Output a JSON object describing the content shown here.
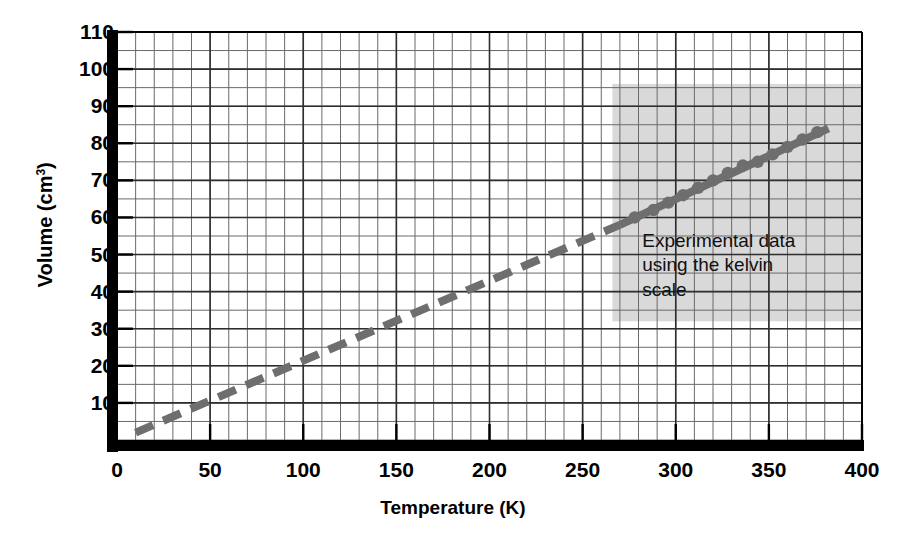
{
  "chart_data": {
    "type": "line",
    "title": "",
    "subtitle": "",
    "xlabel": "Temperature (K)",
    "ylabel": "Volume (cm",
    "ylabel_sup": "3",
    "ylabel_suffix": ")",
    "ylabel_full": "Volume (cm3 )",
    "xlim": [
      0,
      400
    ],
    "ylim": [
      0,
      110
    ],
    "x_ticks": [
      0,
      50,
      100,
      150,
      200,
      250,
      300,
      350,
      400
    ],
    "y_ticks": [
      10,
      20,
      30,
      40,
      50,
      60,
      70,
      80,
      90,
      100,
      110
    ],
    "x_tick_labels": [
      "0",
      "50",
      "100",
      "150",
      "200",
      "250",
      "300",
      "350",
      "400"
    ],
    "y_tick_labels": [
      "10",
      "20",
      "30",
      "40",
      "50",
      "60",
      "70",
      "80",
      "90",
      "100",
      "110"
    ],
    "x_minor_step": 10,
    "y_minor_step": 5,
    "grid": true,
    "legend": false,
    "legend_position": "none",
    "annotations": [
      {
        "text": "Experimental data\nusing the kelvin\nscale",
        "x": 282,
        "y": 52
      }
    ],
    "shaded_region": {
      "x_range": [
        266,
        400
      ],
      "y_range": [
        32,
        96
      ],
      "color": "#d9d9d9"
    },
    "series": [
      {
        "name": "Extrapolated line",
        "style": "dashed",
        "color": "#6e6e6e",
        "x": [
          10,
          270
        ],
        "y": [
          2,
          58
        ]
      },
      {
        "name": "Experimental line",
        "style": "solid",
        "color": "#6e6e6e",
        "x": [
          270,
          382
        ],
        "y": [
          58,
          84
        ]
      },
      {
        "name": "Experimental data points",
        "style": "markers",
        "color": "#6e6e6e",
        "x": [
          278,
          288,
          296,
          304,
          312,
          320,
          328,
          336,
          344,
          352,
          360,
          368,
          376
        ],
        "y": [
          60,
          62,
          64,
          66,
          68,
          70,
          72,
          74,
          75,
          77,
          79,
          81,
          83
        ]
      }
    ],
    "colors": {
      "axis": "#000000",
      "grid": "#555555",
      "line": "#6e6e6e",
      "marker": "#6e6e6e",
      "shading": "#d9d9d9",
      "background": "#ffffff"
    }
  }
}
